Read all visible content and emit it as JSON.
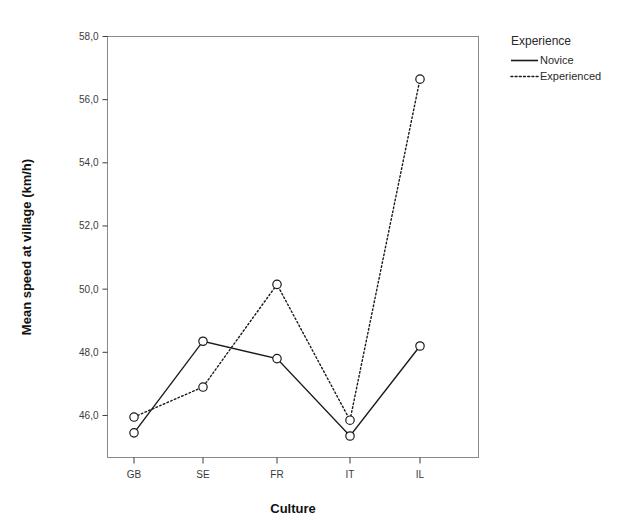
{
  "chart_data": {
    "type": "line",
    "title": "",
    "xlabel": "Culture",
    "ylabel": "Mean speed at village (km/h)",
    "categories": [
      "GB",
      "SE",
      "FR",
      "IT",
      "IL"
    ],
    "ytick_labels": [
      "58,0",
      "56,0",
      "54,0",
      "52,0",
      "50,0",
      "48,0",
      "46,0"
    ],
    "ytick_values": [
      58.0,
      56.0,
      54.0,
      52.0,
      50.0,
      48.0,
      46.0
    ],
    "ylim": [
      45.0,
      58.0
    ],
    "grid": false,
    "legend_position": "right",
    "marker": "open-circle",
    "series": [
      {
        "name": "Novice",
        "linestyle": "solid",
        "color": "#1a1a1a",
        "values": [
          45.45,
          48.35,
          47.8,
          45.35,
          48.2
        ]
      },
      {
        "name": "Experienced",
        "linestyle": "dotted",
        "color": "#1a1a1a",
        "values": [
          45.95,
          46.9,
          50.15,
          45.85,
          56.65
        ]
      }
    ]
  },
  "legend": {
    "title": "Experience",
    "items": [
      {
        "label": "Novice",
        "style": "solid"
      },
      {
        "label": "Experienced",
        "style": "dotted"
      }
    ]
  },
  "axes": {
    "x_title": "Culture",
    "y_title": "Mean speed at village (km/h)"
  }
}
